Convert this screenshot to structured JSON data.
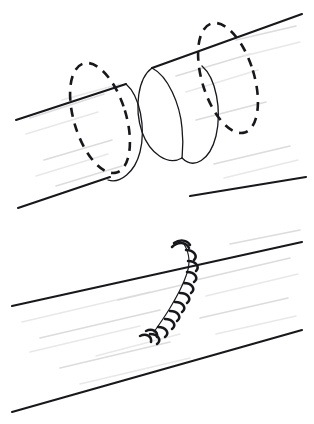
{
  "figure": {
    "background_color": "#ffffff",
    "ink_color": "#17171c",
    "texture_color": "#dcdcdc",
    "width": 314,
    "height": 424,
    "panel_count": 2
  },
  "panels": [
    {
      "id": "panel-transected",
      "label": "Transected tube with separated cut ends",
      "step_number": "1",
      "region": {
        "x": 0,
        "y": 0,
        "width": 314,
        "height": 212
      },
      "elements": {
        "left_segment_label": "Proximal tube segment",
        "right_segment_label": "Distal tube segment",
        "gap_label": "Transection gap",
        "left_cut_face_label": "Proximal cut end",
        "right_cut_face_label": "Distal cut end",
        "hidden_edge_style": "dashed",
        "visible_edge_style": "solid"
      }
    },
    {
      "id": "panel-sutured",
      "label": "Repaired tube with interrupted sutures",
      "step_number": "2",
      "region": {
        "x": 0,
        "y": 212,
        "width": 314,
        "height": 212
      },
      "elements": {
        "tube_label": "Reapproximated tube",
        "suture_line_label": "Anastomosis suture line",
        "stitch_count": 10,
        "stitch_type": "interrupted",
        "knot_label": "Suture knot"
      }
    }
  ],
  "geometry": {
    "tube_axis_angle_deg": -31,
    "panel1": {
      "top_wall": {
        "x1": 18,
        "y1": 40,
        "x2": 300,
        "y2": 14
      },
      "bottom_wall_left": {
        "x1": 18,
        "y1": 208,
        "x2": 108,
        "y2": 178
      },
      "bottom_wall_right": {
        "x1": 196,
        "y1": 196,
        "x2": 306,
        "y2": 178
      },
      "left_cut_center": {
        "x": 102,
        "y": 116
      },
      "right_cut_center": {
        "x": 170,
        "y": 94
      },
      "left_hidden_center": {
        "x": 100,
        "y": 118
      },
      "right_hidden_center": {
        "x": 228,
        "y": 78
      },
      "ellipse_rx": 26,
      "ellipse_ry": 57,
      "ellipse_rotation_deg": -17
    },
    "panel2": {
      "top_wall": {
        "x1": 12,
        "y1": 306,
        "x2": 302,
        "y2": 242
      },
      "bottom_wall": {
        "x1": 12,
        "y1": 412,
        "x2": 302,
        "y2": 330
      },
      "suture_line_top": {
        "x": 184,
        "y": 243
      },
      "suture_line_bottom": {
        "x": 156,
        "y": 332
      }
    }
  },
  "stitches": [
    {
      "index": 1,
      "x": 181,
      "y": 248,
      "angle": -28
    },
    {
      "index": 2,
      "x": 186,
      "y": 258,
      "angle": -26
    },
    {
      "index": 3,
      "x": 187,
      "y": 268,
      "angle": -24
    },
    {
      "index": 4,
      "x": 185,
      "y": 278,
      "angle": -22
    },
    {
      "index": 5,
      "x": 181,
      "y": 288,
      "angle": -20
    },
    {
      "index": 6,
      "x": 177,
      "y": 297,
      "angle": -18
    },
    {
      "index": 7,
      "x": 173,
      "y": 306,
      "angle": -16
    },
    {
      "index": 8,
      "x": 168,
      "y": 314,
      "angle": -14
    },
    {
      "index": 9,
      "x": 163,
      "y": 322,
      "angle": -12
    },
    {
      "index": 10,
      "x": 158,
      "y": 330,
      "angle": -10
    }
  ],
  "texture_lines": {
    "count": 26,
    "description": "faint longitudinal highlight strokes along tube walls"
  }
}
